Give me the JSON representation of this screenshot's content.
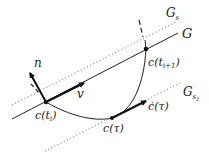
{
  "diagram": {
    "labels": {
      "G": "G",
      "Gs_main": "G",
      "Gs_sub": "s",
      "Gs1_main": "G",
      "Gs1_sub": "s",
      "Gs1_subsub": "1",
      "n": "n",
      "v": "v",
      "c_ti": "c(t",
      "c_ti_sub": "i",
      "c_ti_close": ")",
      "c_ti1": "c(t",
      "c_ti1_sub": "i+1",
      "c_ti1_close": ")",
      "c_tau": "c(τ)",
      "cdot_tau": "ċ(τ)"
    },
    "colors": {
      "line": "#222222",
      "dotted": "#888888",
      "background": "#ffffff"
    }
  }
}
